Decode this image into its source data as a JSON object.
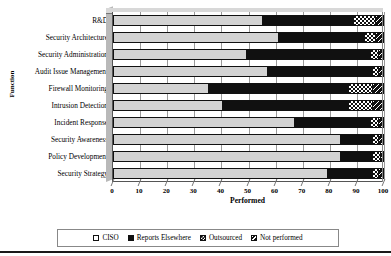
{
  "chart_data": {
    "type": "bar",
    "subtype": "stacked-horizontal-100pct",
    "title": "",
    "xlabel": "Performed",
    "ylabel": "Function",
    "xlim": [
      0,
      100
    ],
    "xticks": [
      0,
      10,
      20,
      30,
      40,
      50,
      60,
      70,
      80,
      90,
      100
    ],
    "grid": true,
    "legend_position": "bottom",
    "categories": [
      "R&D",
      "Security Architecture",
      "Security Administration",
      "Audit Issue Management",
      "Firewall Monitoring",
      "Intrusion Detection",
      "Incident Response",
      "Security Awareness",
      "Policy Development",
      "Security Strategy"
    ],
    "series": [
      {
        "name": "CISO",
        "values": [
          55,
          61,
          49,
          57,
          35,
          40,
          67,
          84,
          84,
          79
        ]
      },
      {
        "name": "Reports Elsewhere",
        "values": [
          34,
          32,
          46,
          39,
          52,
          47,
          28,
          12,
          12,
          17
        ]
      },
      {
        "name": "Outsourced",
        "values": [
          8,
          4,
          3,
          2,
          9,
          9,
          3,
          2,
          3,
          2
        ]
      },
      {
        "name": "Not performed",
        "values": [
          3,
          3,
          2,
          2,
          4,
          4,
          2,
          2,
          1,
          2
        ]
      }
    ]
  },
  "legend": {
    "items": [
      {
        "label": "CISO",
        "swatch": "ciso-swatch-icon"
      },
      {
        "label": "Reports Elsewhere",
        "swatch": "reports-elsewhere-swatch-icon"
      },
      {
        "label": "Outsourced",
        "swatch": "outsourced-swatch-icon"
      },
      {
        "label": "Not performed",
        "swatch": "not-performed-swatch-icon"
      }
    ]
  },
  "colors": {
    "ciso": "#d3d3d3",
    "reports_elsewhere": "#101010",
    "outsourced": "#101010",
    "not_performed": "#101010",
    "axis": "#555555",
    "gridline": "#9a9a9a",
    "floor": "#d8d8d8"
  }
}
